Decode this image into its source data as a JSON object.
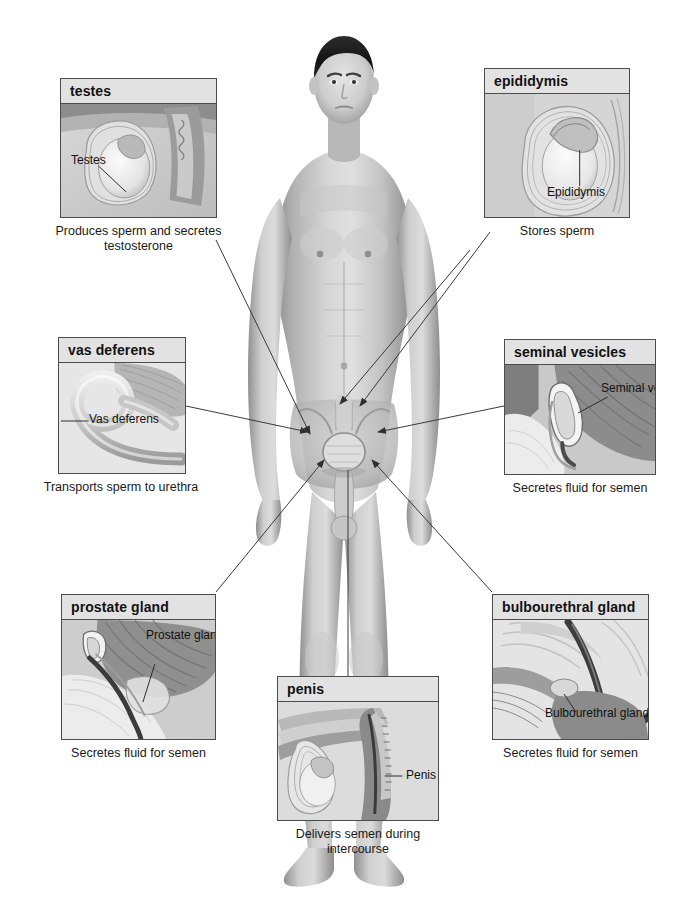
{
  "figure": {
    "alt_name": "male-body-anterior-view"
  },
  "panels": [
    {
      "id": "testes",
      "title": "testes",
      "callout": "Testes",
      "caption": "Produces sperm and secretes testosterone"
    },
    {
      "id": "epididymis",
      "title": "epididymis",
      "callout": "Epididymis",
      "caption": "Stores sperm"
    },
    {
      "id": "vas-deferens",
      "title": "vas deferens",
      "callout": "Vas deferens",
      "caption": "Transports sperm to urethra"
    },
    {
      "id": "seminal-vesicles",
      "title": "seminal vesicles",
      "callout": "Seminal vesicles",
      "caption": "Secretes fluid for semen"
    },
    {
      "id": "prostate-gland",
      "title": "prostate gland",
      "callout": "Prostate gland",
      "caption": "Secretes fluid for semen"
    },
    {
      "id": "bulbourethral-gland",
      "title": "bulbourethral gland",
      "callout": "Bulbourethral gland",
      "caption": "Secretes fluid for semen"
    },
    {
      "id": "penis",
      "title": "penis",
      "callout": "Penis",
      "caption": "Delivers semen during intercourse"
    }
  ],
  "colors": {
    "panel_border": "#4c4c4c",
    "title_background": "#e2e2e2",
    "connector_line": "#3a3a3a",
    "text": "#111111",
    "page_background": "#ffffff"
  },
  "credit": ""
}
